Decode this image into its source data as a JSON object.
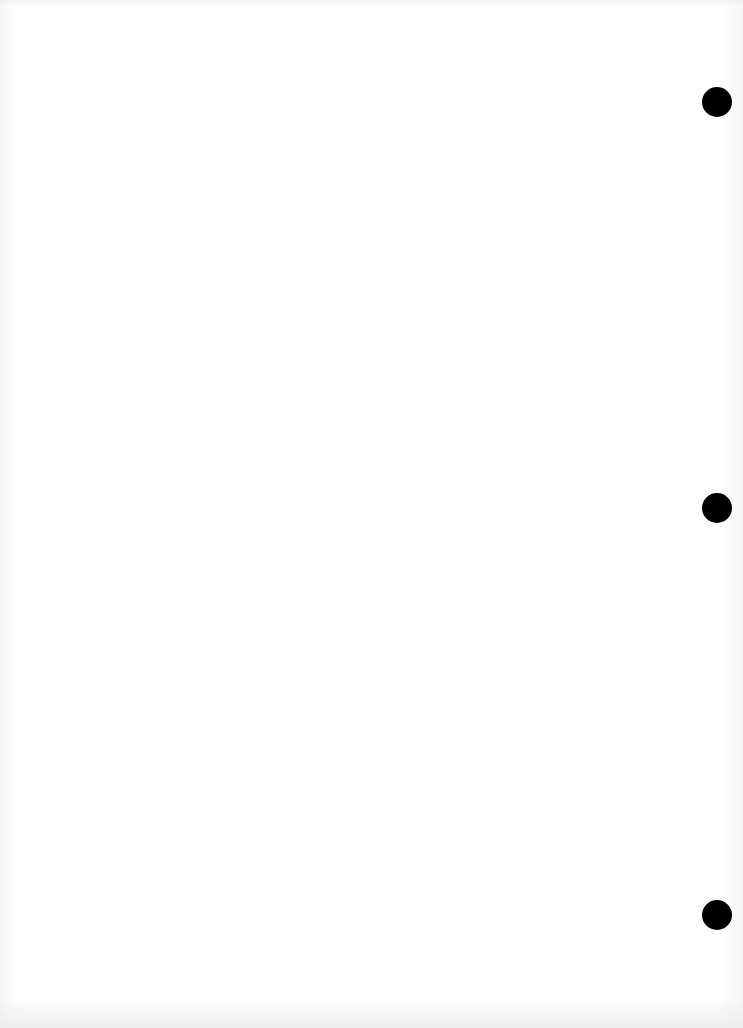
{
  "document": {
    "type": "scanned blank page",
    "show_through_text": {
      "top_line_1": "",
      "top_line_2": "",
      "top_line_3": "",
      "bottom_line_left": "",
      "bottom_line_right": ""
    }
  },
  "punch_holes": [
    {
      "cx": 717,
      "cy": 102,
      "r": 15,
      "color": "#000000"
    },
    {
      "cx": 717,
      "cy": 508,
      "r": 15,
      "color": "#000000"
    },
    {
      "cx": 717,
      "cy": 915,
      "r": 15,
      "color": "#000000"
    }
  ],
  "colors": {
    "paper": "#ffffff",
    "hole": "#000000",
    "show_through": "#ececec"
  }
}
